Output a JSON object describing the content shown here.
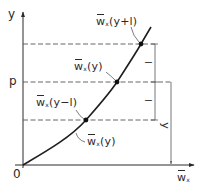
{
  "diagram": {
    "type": "function-curve-with-shifted-levels",
    "axes": {
      "y_label": "y",
      "x_label_base": "w",
      "x_label_sub": "x",
      "origin_label": "0",
      "level_label_p": "p"
    },
    "points": [
      {
        "id": "upper",
        "label_base": "w",
        "label_sub": "x",
        "label_arg": "(y+l)"
      },
      {
        "id": "middle",
        "label_base": "w",
        "label_sub": "x",
        "label_arg": "(y)"
      },
      {
        "id": "lower",
        "label_base": "w",
        "label_sub": "x",
        "label_arg": "(y−l)"
      }
    ],
    "curve_label": {
      "label_base": "w",
      "label_sub": "x",
      "label_arg": "(y)"
    },
    "dimensions": {
      "upper_interval": "l",
      "lower_interval": "l",
      "height": "y"
    },
    "colors": {
      "line": "#2a2a2a",
      "guide": "#555555",
      "background": "#ffffff"
    }
  }
}
